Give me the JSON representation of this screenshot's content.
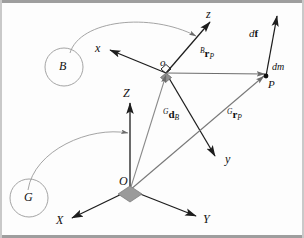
{
  "figure": {
    "background_color": "#fdfdfd",
    "line_color": "#222222",
    "faint_line_color": "#9a9a9a",
    "marker_color": "#8c8c8c"
  },
  "frames": {
    "body": {
      "badge_label": "B",
      "origin_label": "o",
      "axes": [
        {
          "name": "x-axis",
          "label": "x"
        },
        {
          "name": "y-axis",
          "label": "y"
        },
        {
          "name": "z-axis",
          "label": "z"
        }
      ]
    },
    "global": {
      "badge_label": "G",
      "origin_label": "O",
      "axes": [
        {
          "name": "X-axis",
          "label": "X"
        },
        {
          "name": "Y-axis",
          "label": "Y"
        },
        {
          "name": "Z-axis",
          "label": "Z"
        }
      ]
    }
  },
  "point": {
    "label": "P",
    "mass_label": "dm",
    "force_label_prefix": "d",
    "force_label_symbol": "f"
  },
  "vectors": [
    {
      "name": "body-position-vector",
      "pre": "B",
      "symbol": "r",
      "sub": "P",
      "text": "Br_P"
    },
    {
      "name": "global-position-vector",
      "pre": "G",
      "symbol": "r",
      "sub": "P",
      "text": "Gr_P"
    },
    {
      "name": "global-body-offset-vector",
      "pre": "G",
      "symbol": "d",
      "sub": "B",
      "text": "Gd_B"
    }
  ]
}
